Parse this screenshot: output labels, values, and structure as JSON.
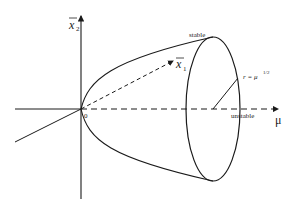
{
  "diagram": {
    "type": "Hopf bifurcation paraboloid",
    "axes": {
      "vertical": {
        "label": "x",
        "subscript": "2",
        "overbar": true
      },
      "oblique": {
        "label": "x",
        "subscript": "1",
        "overbar": true
      },
      "horizontal": {
        "label": "μ"
      }
    },
    "origin_label": "0",
    "annotations": {
      "stable": "stable",
      "unstable": "unstable",
      "radius": "r = μ",
      "radius_exp": "1/2"
    },
    "colors": {
      "stroke": "#1a1a1a",
      "background": "#ffffff"
    }
  }
}
